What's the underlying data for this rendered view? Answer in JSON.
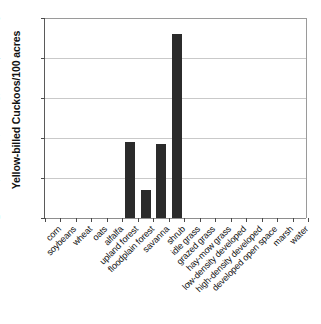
{
  "chart_data": {
    "type": "bar",
    "title": "",
    "xlabel": "",
    "ylabel": "Yellow-billed Cuckoos/100 acres",
    "ylim": [
      0,
      5
    ],
    "yticks": [
      0,
      1,
      2,
      3,
      4,
      5
    ],
    "grid": true,
    "legend": "none",
    "bar_color": "#2b2b2b",
    "categories": [
      "corn",
      "soybeans",
      "wheat",
      "oats",
      "alfalfa",
      "upland forest",
      "floodplain forest",
      "savanna",
      "shrub",
      "idle grass",
      "grazed grass",
      "hay-mow grass",
      "low-density developed",
      "high-density developed",
      "developed open space",
      "marsh",
      "water"
    ],
    "values": [
      0,
      0,
      0,
      0,
      0,
      1.9,
      0.7,
      1.85,
      4.6,
      0,
      0,
      0,
      0,
      0,
      0,
      0,
      0
    ]
  }
}
